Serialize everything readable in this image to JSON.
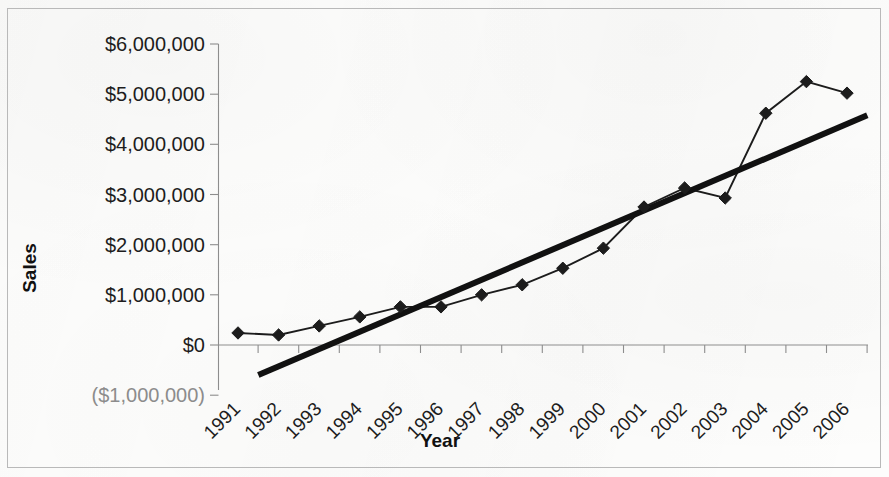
{
  "chart_data": {
    "type": "line",
    "title": "",
    "xlabel": "Year",
    "ylabel": "Sales",
    "grid": false,
    "legend": "none",
    "categories": [
      "1991",
      "1992",
      "1993",
      "1994",
      "1995",
      "1996",
      "1997",
      "1998",
      "1999",
      "2000",
      "2001",
      "2002",
      "2003",
      "2004",
      "2005",
      "2006"
    ],
    "ytick_labels": [
      "$6,000,000",
      "$5,000,000",
      "$4,000,000",
      "$3,000,000",
      "$2,000,000",
      "$1,000,000",
      "$0",
      "($1,000,000)"
    ],
    "ytick_values": [
      6000000,
      5000000,
      4000000,
      3000000,
      2000000,
      1000000,
      0,
      -1000000
    ],
    "ylim": [
      -1000000,
      6000000
    ],
    "series": [
      {
        "name": "Sales",
        "marker": "diamond",
        "color": "#1c1c1c",
        "values": [
          240000,
          200000,
          380000,
          560000,
          760000,
          760000,
          1000000,
          1200000,
          1530000,
          1930000,
          2750000,
          3130000,
          2930000,
          4620000,
          5250000,
          5020000
        ]
      },
      {
        "name": "Linear trendline",
        "marker": "none",
        "color": "#111111",
        "trendline": true,
        "start": {
          "x": "1991.5",
          "y": -600000
        },
        "end": {
          "x": "2006.5",
          "y": 4580000
        }
      }
    ],
    "negative_label_color": "#8c8c8c",
    "axis_color": "#8d8d8d",
    "border_color": "#b9b9b9",
    "background_color": "#fdfdfc"
  }
}
